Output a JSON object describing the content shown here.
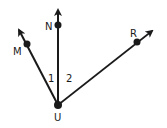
{
  "diagram": {
    "vertex": {
      "label": "U",
      "x": 58,
      "y": 105
    },
    "rays": [
      {
        "label": "M",
        "point": [
          27,
          44
        ],
        "tip": [
          18,
          28
        ]
      },
      {
        "label": "N",
        "point": [
          58,
          25
        ],
        "tip": [
          58,
          8
        ]
      },
      {
        "label": "R",
        "point": [
          137,
          42
        ],
        "tip": [
          154,
          30
        ]
      }
    ],
    "angles": [
      {
        "label": "1",
        "between": [
          "M",
          "N"
        ]
      },
      {
        "label": "2",
        "between": [
          "N",
          "R"
        ]
      }
    ],
    "color": "#1a1a1a"
  }
}
